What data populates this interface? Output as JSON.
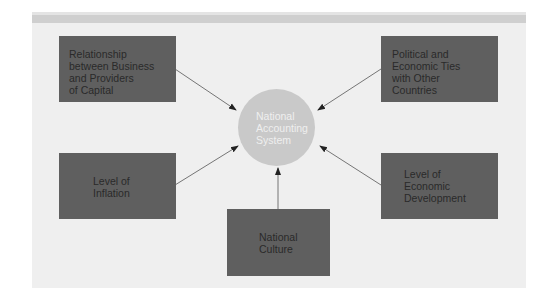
{
  "diagram": {
    "center": {
      "label": "National Accounting System",
      "lines": [
        "National",
        "Accounting",
        "System"
      ]
    },
    "factors": [
      {
        "id": "capital",
        "lines": [
          "Relationship",
          "between Business",
          "and Providers",
          "of Capital"
        ]
      },
      {
        "id": "ties",
        "lines": [
          "Political and",
          "Economic Ties",
          "with Other",
          "Countries"
        ]
      },
      {
        "id": "inflation",
        "lines": [
          "Level of",
          "Inflation"
        ]
      },
      {
        "id": "development",
        "lines": [
          "Level of",
          "Economic",
          "Development"
        ]
      },
      {
        "id": "culture",
        "lines": [
          "National",
          "Culture"
        ]
      }
    ],
    "colors": {
      "box": "#5f5f5f",
      "circle": "#c9c9c9",
      "panel": "#efefef",
      "band": "#cfcfcf",
      "arrow": "#333333"
    }
  }
}
